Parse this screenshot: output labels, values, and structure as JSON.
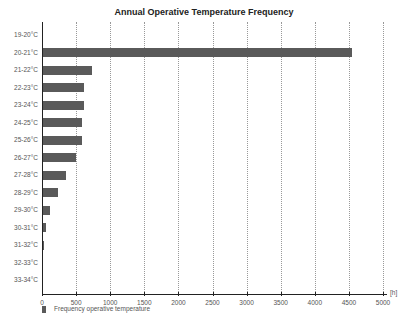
{
  "chart_data": {
    "type": "bar",
    "orientation": "horizontal",
    "title": "Annual Operative Temperature Frequency",
    "xlabel": "[h]",
    "ylabel": "",
    "xlim": [
      0,
      5000
    ],
    "xticks": [
      "0",
      "500",
      "1000",
      "1500",
      "2000",
      "2500",
      "3000",
      "3500",
      "4000",
      "4500",
      "5000"
    ],
    "grid": "vertical dotted",
    "legend_position": "bottom-left",
    "categories": [
      "19-20°C",
      "20-21°C",
      "21-22°C",
      "22-23°C",
      "23-24°C",
      "24-25°C",
      "25-26°C",
      "26-27°C",
      "27-28°C",
      "28-29°C",
      "29-30°C",
      "30-31°C",
      "31-32°C",
      "32-33°C",
      "33-34°C"
    ],
    "series": [
      {
        "name": "Frequency operative temperature",
        "color": "#5a5a5a",
        "values": [
          0,
          4540,
          730,
          615,
          620,
          585,
          590,
          495,
          350,
          235,
          115,
          55,
          35,
          5,
          0
        ]
      }
    ]
  },
  "title": "Annual Operative Temperature Frequency",
  "unit": "[h]",
  "legend": {
    "label": "Frequency operative temperature"
  }
}
